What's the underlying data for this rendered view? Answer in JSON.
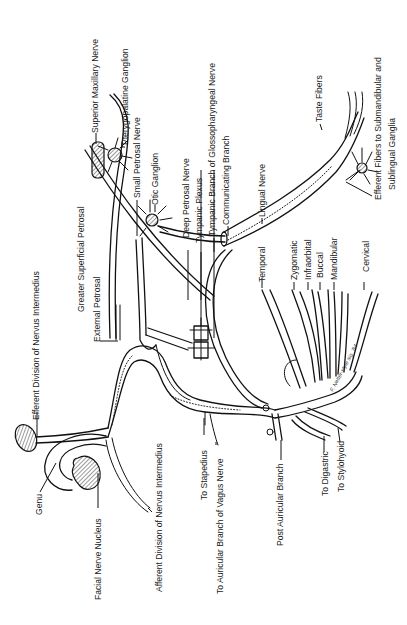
{
  "diagram": {
    "orientation": "labels rotated 90 degrees counter-clockwise",
    "colors": {
      "line": "#111111",
      "background": "#ffffff",
      "text": "#1a1a1a"
    },
    "labels": {
      "superior_maxillary_nerve": "Superior Maxillary Nerve",
      "pterygopalatine_ganglion": "Pterygopalatine Ganglion",
      "small_petrosal_nerve": "Small Petrosal Nerve",
      "otic_ganglion": "Otic Ganglion",
      "deep_petrosal_nerve": "Deep Petrosal Nerve",
      "tympanic_plexus": "Tympanic Plexus",
      "tympanic_branch_glossopharyngeal": "Tympanic Branch of Glossopharyngeal Nerve",
      "communicating_branch": "Communicating Branch",
      "lingual_nerve": "Lingual Nerve",
      "taste_fibers": "Taste Fibers",
      "efferent_fibers_submandibular_line1": "Efferent Fibers to Submandibular and",
      "efferent_fibers_submandibular_line2": "Sublingual Ganglia",
      "greater_superficial_petrosal": "Greater Superficial Petrosal",
      "external_petrosal": "External Petrosal",
      "efferent_division_nervus_intermedius": "Efferent Division of Nervus Intermedius",
      "temporal": "Temporal",
      "zygomatic": "Zygomatic",
      "infraorbital": "Infraorbital",
      "buccal": "Buccal",
      "mandibular": "Mandibular",
      "cervical": "Cervical",
      "genu": "Genu",
      "facial_nerve_nucleus": "Facial Nerve Nucleus",
      "afferent_division_nervus_intermedius": "Afferent Division of Nervus Intermedius",
      "to_stapedius": "To Stapedius",
      "to_auricular_branch_vagus": "To Auricular Branch of Vagus Nerve",
      "post_auricular_branch": "Post Auricular Branch",
      "to_digastric": "To Digastric",
      "to_stylohyoid": "To Stylohyoid"
    },
    "artist_signature": "F. Netter-style sig. '84"
  }
}
